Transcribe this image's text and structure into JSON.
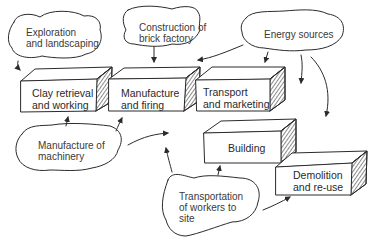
{
  "diagram": {
    "type": "process-flow",
    "style": "hand-drawn",
    "colors": {
      "stroke": "#2b2b2b",
      "text": "#333333",
      "background": "#ffffff"
    },
    "stages": [
      {
        "id": "clay",
        "line1": "Clay retrieval",
        "line2": "and working"
      },
      {
        "id": "manufacture",
        "line1": "Manufacture",
        "line2": "and firing"
      },
      {
        "id": "transport",
        "line1": "Transport",
        "line2": "and marketing"
      },
      {
        "id": "building",
        "line1": "Building",
        "line2": ""
      },
      {
        "id": "demolition",
        "line1": "Demolition",
        "line2": "and re-use"
      }
    ],
    "inputs": [
      {
        "id": "exploration",
        "line1": "Exploration",
        "line2": "and landscaping",
        "line3": ""
      },
      {
        "id": "construction",
        "line1": "Construction of",
        "line2": "brick factory",
        "line3": ""
      },
      {
        "id": "energy",
        "line1": "Energy sources",
        "line2": "",
        "line3": ""
      },
      {
        "id": "machinery",
        "line1": "Manufacture of",
        "line2": "machinery",
        "line3": ""
      },
      {
        "id": "workers",
        "line1": "Transportation",
        "line2": "of workers to",
        "line3": "site"
      }
    ],
    "connections": [
      {
        "from": "exploration",
        "to": "clay"
      },
      {
        "from": "construction",
        "to": "manufacture"
      },
      {
        "from": "energy",
        "to": "manufacture"
      },
      {
        "from": "energy",
        "to": "transport"
      },
      {
        "from": "energy",
        "to": "building"
      },
      {
        "from": "energy",
        "to": "demolition"
      },
      {
        "from": "machinery",
        "to": "clay"
      },
      {
        "from": "machinery",
        "to": "manufacture"
      },
      {
        "from": "machinery",
        "to": "building"
      },
      {
        "from": "workers",
        "to": "building"
      },
      {
        "from": "workers",
        "to": "demolition"
      }
    ]
  }
}
